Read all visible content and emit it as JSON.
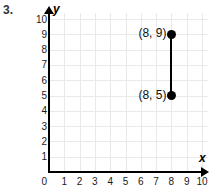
{
  "problem": {
    "number": "3."
  },
  "chart_data": {
    "type": "scatter",
    "title": "",
    "xlabel": "x",
    "ylabel": "y",
    "xlim": [
      0,
      10
    ],
    "ylim": [
      0,
      10
    ],
    "grid": true,
    "legend": "none",
    "x_ticks": [
      "0",
      "1",
      "2",
      "3",
      "4",
      "5",
      "6",
      "7",
      "8",
      "9",
      "10"
    ],
    "y_ticks": [
      "0",
      "1",
      "2",
      "3",
      "4",
      "5",
      "6",
      "7",
      "8",
      "9",
      "10"
    ],
    "origin_label": "0",
    "points": [
      {
        "x": 8,
        "y": 9,
        "label": "(8, 9)"
      },
      {
        "x": 8,
        "y": 5,
        "label": "(8, 5)"
      }
    ],
    "segments": [
      {
        "x1": 8,
        "y1": 5,
        "x2": 8,
        "y2": 9
      }
    ],
    "colors": {
      "point": "#000000",
      "segment": "#000000",
      "grid": "#e9e9e9",
      "axis": "#000000",
      "background": "#ffffff"
    }
  }
}
